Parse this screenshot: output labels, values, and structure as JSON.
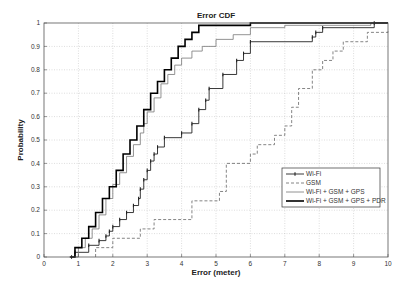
{
  "chart_data": {
    "type": "line",
    "subtype": "step-cdf",
    "title": "Error CDF",
    "xlabel": "Error (meter)",
    "ylabel": "Probability",
    "xlim": [
      0,
      10
    ],
    "ylim": [
      0,
      1
    ],
    "xticks": [
      0,
      1,
      2,
      3,
      4,
      5,
      6,
      7,
      8,
      9,
      10
    ],
    "yticks": [
      0,
      0.1,
      0.2,
      0.3,
      0.4,
      0.5,
      0.6,
      0.7,
      0.8,
      0.9,
      1
    ],
    "grid": true,
    "legend_position": "lower right",
    "series": [
      {
        "name": "Wi-Fi",
        "style": "solid-marker",
        "color": "#222222",
        "x": [
          0.8,
          0.9,
          1.3,
          1.6,
          1.8,
          1.9,
          2.0,
          2.2,
          2.4,
          2.6,
          2.75,
          2.8,
          2.9,
          3.0,
          3.1,
          3.2,
          3.3,
          3.5,
          4.0,
          4.3,
          4.5,
          4.7,
          4.8,
          5.2,
          5.6,
          5.8,
          6.0,
          7.8,
          7.9,
          8.1,
          9.6
        ],
        "y": [
          0.0,
          0.02,
          0.05,
          0.07,
          0.09,
          0.11,
          0.13,
          0.16,
          0.19,
          0.22,
          0.25,
          0.29,
          0.33,
          0.37,
          0.41,
          0.44,
          0.47,
          0.51,
          0.53,
          0.57,
          0.63,
          0.67,
          0.72,
          0.78,
          0.84,
          0.87,
          0.92,
          0.94,
          0.96,
          0.98,
          1.0
        ]
      },
      {
        "name": "GSM",
        "style": "dashed",
        "color": "#666666",
        "x": [
          1.5,
          2.0,
          2.8,
          3.2,
          4.3,
          5.1,
          5.3,
          6.0,
          6.2,
          6.7,
          7.0,
          7.2,
          7.4,
          7.8,
          8.1,
          8.4,
          8.7,
          9.4,
          10.0
        ],
        "y": [
          0.04,
          0.08,
          0.12,
          0.16,
          0.24,
          0.28,
          0.4,
          0.44,
          0.48,
          0.52,
          0.56,
          0.64,
          0.72,
          0.8,
          0.84,
          0.88,
          0.92,
          0.96,
          0.97
        ]
      },
      {
        "name": "Wi-Fi + GSM + GPS",
        "style": "solid-thin",
        "color": "#777777",
        "x": [
          0.8,
          1.0,
          1.2,
          1.4,
          1.6,
          1.8,
          2.0,
          2.2,
          2.4,
          2.6,
          2.8,
          2.9,
          3.0,
          3.2,
          3.4,
          3.6,
          3.8,
          4.0,
          4.3,
          4.6,
          5.0,
          5.5,
          6.0,
          7.0,
          8.0,
          9.5
        ],
        "y": [
          0.0,
          0.04,
          0.08,
          0.12,
          0.18,
          0.25,
          0.31,
          0.36,
          0.43,
          0.48,
          0.53,
          0.57,
          0.62,
          0.68,
          0.74,
          0.78,
          0.82,
          0.85,
          0.88,
          0.9,
          0.93,
          0.95,
          0.98,
          0.99,
          0.99,
          1.0
        ]
      },
      {
        "name": "Wi-Fi + GSM + GPS + PDR",
        "style": "solid-thick",
        "color": "#000000",
        "x": [
          0.75,
          0.9,
          1.1,
          1.3,
          1.5,
          1.7,
          1.9,
          2.1,
          2.3,
          2.5,
          2.7,
          2.9,
          3.1,
          3.3,
          3.5,
          3.7,
          3.9,
          4.1,
          4.3,
          4.5,
          5.0,
          6.0
        ],
        "y": [
          0.0,
          0.04,
          0.08,
          0.13,
          0.19,
          0.25,
          0.3,
          0.37,
          0.44,
          0.5,
          0.56,
          0.63,
          0.7,
          0.75,
          0.8,
          0.85,
          0.9,
          0.93,
          0.96,
          0.99,
          0.99,
          1.0
        ]
      }
    ]
  }
}
